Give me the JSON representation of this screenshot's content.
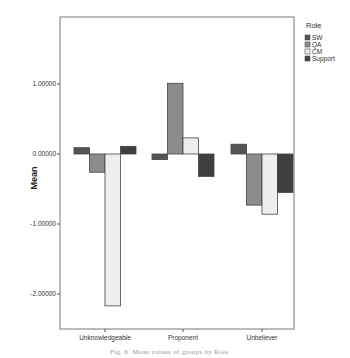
{
  "chart_data": {
    "type": "bar",
    "title": "",
    "xlabel": "",
    "ylabel": "Mean",
    "ylim": [
      -2.4,
      1.95
    ],
    "yticks": [
      1.0,
      0.0,
      -1.0,
      -2.0
    ],
    "ytick_labels": [
      "1.00000",
      "0.00000",
      "-1.00000",
      "-2.00000"
    ],
    "categories": [
      "Unknowledgeable",
      "Proponent",
      "Unbeliever"
    ],
    "legend": {
      "title": "Role",
      "position": "right-top"
    },
    "grid": false,
    "series": [
      {
        "name": "SW",
        "color": "#555555",
        "values": [
          0.09,
          -0.08,
          0.14
        ]
      },
      {
        "name": "QA",
        "color": "#8c8c8c",
        "values": [
          -0.26,
          1.01,
          -0.73
        ]
      },
      {
        "name": "CM",
        "color": "#eeeeee",
        "values": [
          -2.17,
          0.23,
          -0.86
        ]
      },
      {
        "name": "Support",
        "color": "#3f3f3f",
        "values": [
          0.11,
          -0.32,
          -0.55
        ]
      }
    ]
  },
  "caption": "Fig. 6. Mean values of groups by Role"
}
